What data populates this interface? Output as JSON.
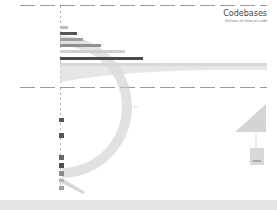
{
  "chart_data": {
    "type": "bar",
    "title": "Codebases",
    "subtitle": "Millions of lines of code",
    "xlabel": "",
    "ylabel": "",
    "orientation": "horizontal",
    "categories": [
      "",
      "",
      "",
      "",
      "",
      "",
      "",
      "",
      ""
    ],
    "values": [
      0.3,
      0.5,
      2,
      4,
      5,
      10,
      16,
      20,
      50
    ],
    "grid": false,
    "legend": "none",
    "bars": [
      {
        "top": 26,
        "width": 8,
        "color": "#bdbdbd"
      },
      {
        "top": 32,
        "width": 17,
        "color": "#555555"
      },
      {
        "top": 38,
        "width": 23,
        "color": "#9e9e9e"
      },
      {
        "top": 44,
        "width": 41,
        "color": "#8f8f8f"
      },
      {
        "top": 50,
        "width": 65,
        "color": "#cfcfcf"
      },
      {
        "top": 57,
        "width": 83,
        "color": "#4a4a4a"
      },
      {
        "top": 63,
        "width": 207,
        "color": "#d8d8d8"
      }
    ],
    "small_bars": [
      {
        "top": 118,
        "height": 4,
        "color": "#555555"
      },
      {
        "top": 133,
        "height": 5,
        "color": "#555555"
      },
      {
        "top": 155,
        "height": 5,
        "color": "#666666"
      },
      {
        "top": 163,
        "height": 5,
        "color": "#4f4f4f"
      },
      {
        "top": 171,
        "height": 5,
        "color": "#8a8a8a"
      },
      {
        "top": 179,
        "height": 3,
        "color": "#b5b5b5"
      },
      {
        "top": 186,
        "height": 4,
        "color": "#9e9e9e"
      }
    ]
  }
}
